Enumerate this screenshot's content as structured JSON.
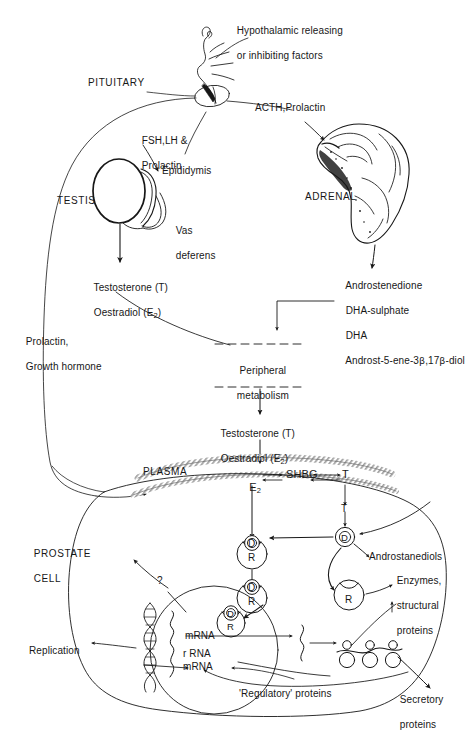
{
  "figure": {
    "type": "biomedical-schematic",
    "width": 471,
    "height": 717,
    "ink_color": "#171717",
    "paper_color": "#ffffff"
  },
  "labels": {
    "hypothalamic_factors_line1": "Hypothalamic releasing",
    "hypothalamic_factors_line2": "or inhibiting factors",
    "pituitary": "PITUITARY",
    "fsh_lh_line1": "FSH,LH &",
    "fsh_lh_line2": "Prolactin",
    "acth_prolactin": "ACTH,Prolactin",
    "testis": "TESTIS",
    "epididymis": "Epididymis",
    "vas_line1": "Vas",
    "vas_line2": "deferens",
    "adrenal": "ADRENAL",
    "testis_output_line1": "Testosterone (T)",
    "testis_output_line2": "Oestradiol (E",
    "testis_output_line2_sub": "2",
    "testis_output_line2_end": ")",
    "adrenal_output_1": "Androstenedione",
    "adrenal_output_2": "DHA-sulphate",
    "adrenal_output_3": "DHA",
    "adrenal_output_4_a": "Androst-5-ene-3",
    "adrenal_output_4_b": "β",
    "adrenal_output_4_c": ",17",
    "adrenal_output_4_d": "β",
    "adrenal_output_4_e": "-diol",
    "prolactin_gh_line1": "Prolactin,",
    "prolactin_gh_line2": "Growth hormone",
    "peripheral_line1": "Peripheral",
    "peripheral_line2": "metabolism",
    "peripheral_output_line1": "Testosterone (T)",
    "peripheral_output_line2": "Oestradiol (E",
    "peripheral_output_line2_sub": "2",
    "peripheral_output_line2_end": ")",
    "plasma": "PLASMA",
    "plasma_e2": "E",
    "plasma_e2_sub": "2",
    "plasma_shbg": "SHBG",
    "plasma_t": "T",
    "prostate_cell_line1": "PROSTATE",
    "prostate_cell_line2": "CELL",
    "question_mark": "?",
    "t_label_membrane": "T",
    "dht_d": "D",
    "receptor_r": "R",
    "androstanediols": "Androstanediols",
    "enzymes_line1": "Enzymes,",
    "enzymes_line2": "structural",
    "enzymes_line3": "proteins",
    "mrna_upper": "mRNA",
    "rrna": "r RNA",
    "mrna_lower": "mRNA",
    "replication": "Replication",
    "regulatory_proteins": "'Regulatory' proteins",
    "secretory_line1": "Secretory",
    "secretory_line2": "proteins"
  },
  "pathways": [
    {
      "from": "hypothalamus",
      "to": "pituitary",
      "label": "Hypothalamic releasing or inhibiting factors"
    },
    {
      "from": "pituitary",
      "to": "testis",
      "label": "FSH,LH & Prolactin"
    },
    {
      "from": "pituitary",
      "to": "adrenal",
      "label": "ACTH,Prolactin"
    },
    {
      "from": "testis",
      "to": "testis_steroids",
      "label": "Testosterone (T) / Oestradiol (E2)"
    },
    {
      "from": "adrenal",
      "to": "adrenal_steroids",
      "label": "Androstenedione, DHA-sulphate, DHA, Androst-5-ene-3β,17β-diol"
    },
    {
      "from": "adrenal_steroids",
      "to": "peripheral_metabolism",
      "label": ""
    },
    {
      "from": "testis_steroids",
      "to": "peripheral_metabolism",
      "label": ""
    },
    {
      "from": "peripheral_metabolism",
      "to": "plasma",
      "label": "Testosterone (T) / Oestradiol (E2)"
    },
    {
      "from": "plasma",
      "to": "prostate_cell",
      "label": "T"
    },
    {
      "from": "prostate_cell",
      "to": "pituitary",
      "label": "Prolactin, Growth hormone feedback"
    },
    {
      "from": "cytoplasmic_receptor",
      "to": "nuclear_receptor",
      "label": "D-R translocation"
    },
    {
      "from": "nucleus",
      "to": "ribosomes",
      "label": "mRNA / r RNA"
    },
    {
      "from": "ribosomes",
      "to": "secretory_proteins",
      "label": "Secretory proteins"
    },
    {
      "from": "ribosomes",
      "to": "enzymes",
      "label": "Enzymes, structural proteins"
    },
    {
      "from": "regulatory_proteins",
      "to": "nucleus",
      "label": "'Regulatory' proteins"
    }
  ]
}
